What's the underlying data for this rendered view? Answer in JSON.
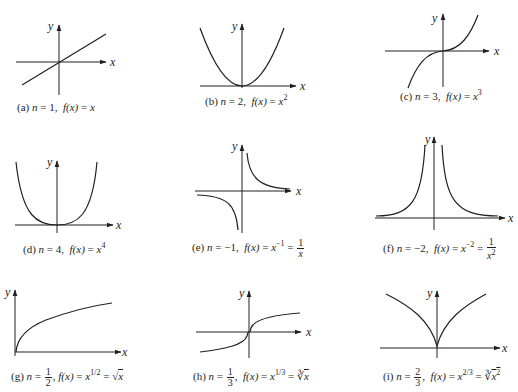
{
  "figure": {
    "axis_labels": {
      "x": "x",
      "y": "y"
    },
    "panels": [
      {
        "id": "a",
        "label": "(a)",
        "n": "1",
        "formula": "f(x) = x",
        "caption": "(a) n = 1,  f(x) = x"
      },
      {
        "id": "b",
        "label": "(b)",
        "n": "2",
        "formula": "f(x) = x^2",
        "caption": "(b) n = 2,  f(x) = x²"
      },
      {
        "id": "c",
        "label": "(c)",
        "n": "3",
        "formula": "f(x) = x^3",
        "caption": "(c) n = 3,  f(x) = x³"
      },
      {
        "id": "d",
        "label": "(d)",
        "n": "4",
        "formula": "f(x) = x^4",
        "caption": "(d) n = 4,  f(x) = x⁴"
      },
      {
        "id": "e",
        "label": "(e)",
        "n": "−1",
        "formula": "f(x) = x^−1 = 1/x",
        "caption": "(e) n = −1,  f(x) = x⁻¹ = 1/x"
      },
      {
        "id": "f",
        "label": "(f)",
        "n": "−2",
        "formula": "f(x) = x^−2 = 1/x^2",
        "caption": "(f) n = −2,  f(x) = x⁻² = 1/x²"
      },
      {
        "id": "g",
        "label": "(g)",
        "n": "1/2",
        "formula": "f(x) = x^1/2 = √x",
        "caption": "(g) n = 1/2,  f(x) = x^1/2 = √x"
      },
      {
        "id": "h",
        "label": "(h)",
        "n": "1/3",
        "formula": "f(x) = x^1/3 = ∛x",
        "caption": "(h) n = 1/3,  f(x) = x^1/3 = ∛x"
      },
      {
        "id": "i",
        "label": "(i)",
        "n": "2/3",
        "formula": "f(x) = x^2/3 = ∛(x^2)",
        "caption": "(i) n = 2/3,  f(x) = x^2/3 = ∛x²"
      }
    ],
    "parts": {
      "eq": "=",
      "comma": ",",
      "fx": "f(x)",
      "x": "x",
      "one": "1",
      "a_label": "(a)",
      "a_n": "1",
      "b_label": "(b)",
      "b_n": "2",
      "b_exp": "2",
      "c_label": "(c)",
      "c_n": "3",
      "c_exp": "3",
      "d_label": "(d)",
      "d_n": "4",
      "d_exp": "4",
      "e_label": "(e)",
      "e_n": "−1",
      "e_exp": "−1",
      "f_label": "(f)",
      "f_n": "−2",
      "f_exp": "−2",
      "f_den_exp": "2",
      "g_label": "(g)",
      "g_num": "1",
      "g_den": "2",
      "g_exp": "1/2",
      "g_root": "√",
      "h_label": "(h)",
      "h_num": "1",
      "h_den": "3",
      "h_exp": "1/3",
      "h_root": "∛",
      "i_label": "(i)",
      "i_num": "2",
      "i_den": "3",
      "i_exp": "2/3",
      "i_root": "∛",
      "i_inner_exp": "2"
    }
  }
}
